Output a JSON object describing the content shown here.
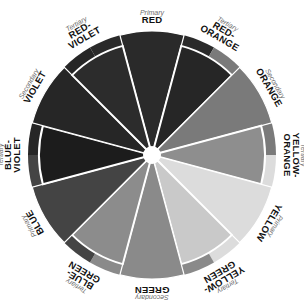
{
  "diagram": {
    "center": {
      "x": 152,
      "y": 155
    },
    "outer_radius": 124,
    "tertiary_radius": 113,
    "hub_radius": 9,
    "label_radius": 132,
    "segments": [
      {
        "name": "RED",
        "lines": [
          "RED"
        ],
        "type": "Primary",
        "shade": "#2a2a2a"
      },
      {
        "name": "RED-ORANGE",
        "lines": [
          "RED-",
          "ORANGE"
        ],
        "type": "Tertiary",
        "shade": "#262626"
      },
      {
        "name": "ORANGE",
        "lines": [
          "ORANGE"
        ],
        "type": "Secondary",
        "shade": "#7a7a7a"
      },
      {
        "name": "YELLOW-ORANGE",
        "lines": [
          "YELLOW-",
          "ORANGE"
        ],
        "type": "Tertiary",
        "shade": "#8e8e8e"
      },
      {
        "name": "YELLOW",
        "lines": [
          "YELLOW"
        ],
        "type": "Primary",
        "shade": "#dcdcdc"
      },
      {
        "name": "YELLOW-GREEN",
        "lines": [
          "YELLOW-",
          "GREEN"
        ],
        "type": "Tertiary",
        "shade": "#c9c9c9"
      },
      {
        "name": "GREEN",
        "lines": [
          "GREEN"
        ],
        "type": "Secondary",
        "shade": "#8a8a8a"
      },
      {
        "name": "BLUE-GREEN",
        "lines": [
          "BLUE-",
          "GREEN"
        ],
        "type": "Tertiary",
        "shade": "#8c8c8c"
      },
      {
        "name": "BLUE",
        "lines": [
          "BLUE"
        ],
        "type": "Primary",
        "shade": "#444444"
      },
      {
        "name": "BLUE-VIOLET",
        "lines": [
          "BLUE-",
          "VIOLET"
        ],
        "type": "Tertiary",
        "shade": "#1c1c1c"
      },
      {
        "name": "VIOLET",
        "lines": [
          "VIOLET"
        ],
        "type": "Secondary",
        "shade": "#262626"
      },
      {
        "name": "RED-VIOLET",
        "lines": [
          "RED-",
          "VIOLET"
        ],
        "type": "Tertiary",
        "shade": "#2c2c2c"
      }
    ],
    "colors": {
      "divider": "#ffffff",
      "hub": "#ffffff",
      "background": "#ffffff"
    }
  }
}
